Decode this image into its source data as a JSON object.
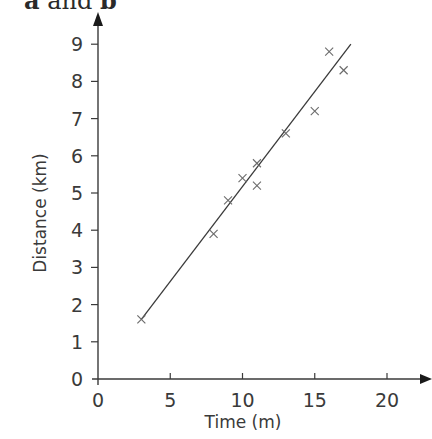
{
  "header": {
    "part_a": "a",
    "connector": " and ",
    "part_b": "b"
  },
  "chart_data": {
    "type": "scatter",
    "title": "",
    "xlabel": "Time (m)",
    "ylabel": "Distance (km)",
    "xlim": [
      0,
      22
    ],
    "ylim": [
      0,
      9.5
    ],
    "x_ticks": [
      0,
      5,
      10,
      15,
      20
    ],
    "y_ticks": [
      0,
      1,
      2,
      3,
      4,
      5,
      6,
      7,
      8,
      9
    ],
    "grid": false,
    "marker": "x",
    "series": [
      {
        "name": "observations",
        "points": [
          {
            "x": 3,
            "y": 1.6
          },
          {
            "x": 8,
            "y": 3.9
          },
          {
            "x": 9,
            "y": 4.8
          },
          {
            "x": 10,
            "y": 5.4
          },
          {
            "x": 11,
            "y": 5.8
          },
          {
            "x": 11,
            "y": 5.2
          },
          {
            "x": 13,
            "y": 6.6
          },
          {
            "x": 15,
            "y": 7.2
          },
          {
            "x": 16,
            "y": 8.8
          },
          {
            "x": 17,
            "y": 8.3
          }
        ]
      }
    ],
    "line_of_best_fit": {
      "start": {
        "x": 3,
        "y": 1.6
      },
      "end": {
        "x": 17.5,
        "y": 9.0
      }
    },
    "colors": {
      "axis": "#3a3a3a",
      "marker": "#6a6a6a",
      "fit_line": "#3a3a3a"
    }
  }
}
